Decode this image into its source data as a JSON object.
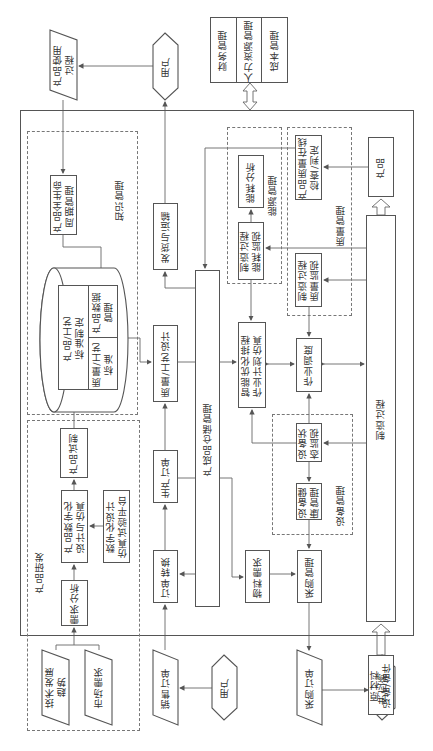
{
  "top": {
    "product_usage": "产品使用\n过程",
    "user_top": "用户",
    "enterprise": [
      "财务管理",
      "人力资源管理",
      "成本管理"
    ]
  },
  "knowledge": {
    "group_label": "知识管理",
    "plm": "产品全生命\n周期管理",
    "standards_title": "产品/工艺\n标准制定",
    "quality_std": "质量/工艺\n标准",
    "pdm": "产品数据\n管理"
  },
  "rnd": {
    "group_label": "产品研发",
    "trial": "产品试制",
    "digital_design": "产品数字化\n设计与仿真",
    "sim_platform": "数字化设计\n仿真试验平台",
    "req_analysis": "需求分析",
    "tech_trend": "技术发展\n趋势",
    "market_demand": "市场需求"
  },
  "orders": {
    "shipping": "发货与运输",
    "quality_design": "质量/工艺设计",
    "production_order": "生产订单",
    "order_conversion": "订单转换",
    "sales_order": "销售订单",
    "user_bottom": "用户",
    "warehouse": "产成品仓储管理"
  },
  "energy": {
    "group_label": "能源管理",
    "analysis": "能耗分析",
    "monitor": "制造过程\n能耗监视"
  },
  "quality": {
    "group_label": "质量管理",
    "online_check": "产品质量在线\n检查/判定",
    "monitor": "制造过程\n质量监视"
  },
  "production": {
    "product": "产品",
    "process": "制造过程",
    "materials": "原材料\n设备/备件",
    "scheduling_sim": "智能优化排程\n作业计划仿真",
    "dispatch": "作业调度"
  },
  "equipment": {
    "group_label": "设备管理",
    "status_monitor": "设备状\n态监视",
    "health": "设备健\n康管理"
  },
  "purchase": {
    "material_req": "物料需求",
    "purchase_mgmt": "采购管理",
    "purchase_order": "采购订单",
    "supplier": "供应商"
  },
  "colors": {
    "line": "#555555",
    "background": "#ffffff"
  }
}
